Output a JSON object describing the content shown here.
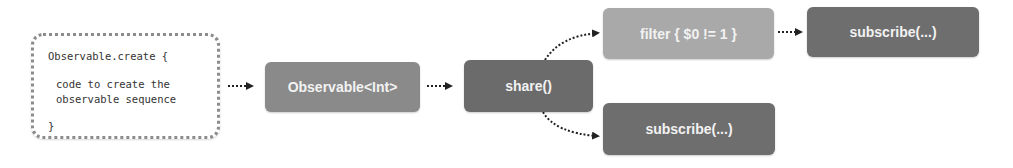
{
  "code_box": {
    "lines": [
      "Observable.create {",
      "code to create the",
      "observable sequence",
      "}"
    ]
  },
  "nodes": {
    "observable": {
      "label": "Observable<Int>",
      "color": "#8a8a8a"
    },
    "share": {
      "label": "share()",
      "color": "#6b6b6b"
    },
    "filter": {
      "label": "filter { $0 != 1 }",
      "color": "#a9a9a9"
    },
    "subscribe_top": {
      "label": "subscribe(...)",
      "color": "#6e6e6e"
    },
    "subscribe_bottom": {
      "label": "subscribe(...)",
      "color": "#6e6e6e"
    }
  },
  "colors": {
    "arrow": "#222222",
    "code_border": "#8c8c8c"
  }
}
